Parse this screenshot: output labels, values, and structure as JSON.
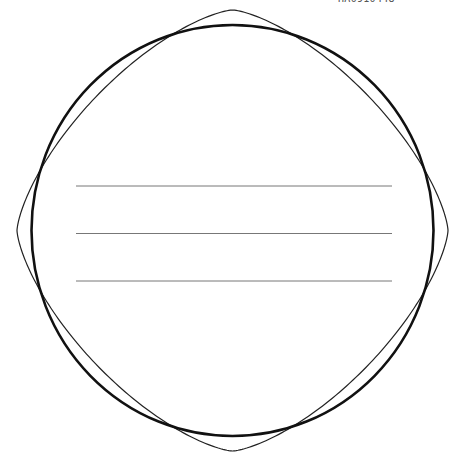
{
  "document": {
    "code_label": "HA0910448"
  },
  "diagram": {
    "circle": {
      "cx": 232.5,
      "cy": 230.5,
      "rx": 201,
      "ry": 205.5,
      "stroke": "#111111",
      "stroke_width": 2.6
    },
    "squircle": {
      "cx": 232.5,
      "cy": 230.5,
      "a": 215.5,
      "b": 220.5,
      "exponent": 1.45,
      "stroke": "#222222",
      "stroke_width": 1.2
    },
    "lines": [
      {
        "x1": 76,
        "x2": 392,
        "y": 186
      },
      {
        "x1": 76,
        "x2": 392,
        "y": 233.5
      },
      {
        "x1": 76,
        "x2": 392,
        "y": 281
      }
    ],
    "line_style": {
      "stroke": "#777777",
      "stroke_width": 1
    }
  }
}
